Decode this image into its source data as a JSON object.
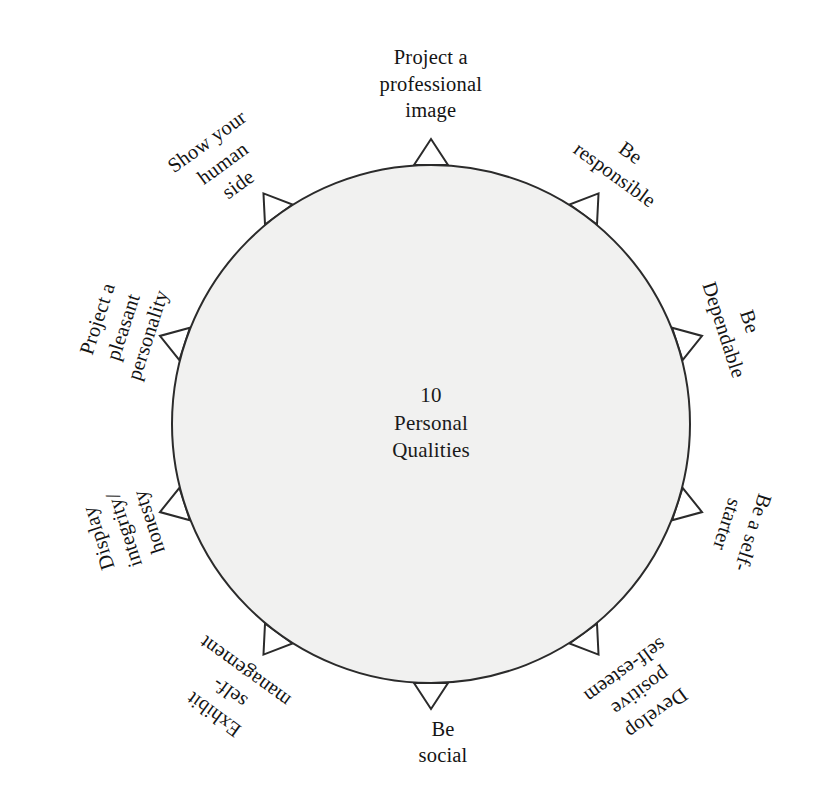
{
  "diagram": {
    "title_center": {
      "lines": [
        "10",
        "Personal",
        "Qualities"
      ]
    },
    "geometry": {
      "center_x": 431,
      "center_y": 424,
      "radius": 259,
      "marker_count": 10,
      "marker_shape": "triangle",
      "circle_fill": "#f1f1f0",
      "circle_stroke": "#2b2b2b",
      "background": "#ffffff"
    },
    "spokes": [
      {
        "name": "project-a-professional-image",
        "lines": [
          "Project a",
          "professional",
          "image"
        ],
        "angle_deg": 0,
        "label_x": 431,
        "label_y": 84,
        "rotation": 0
      },
      {
        "name": "be-responsible",
        "lines": [
          "Be",
          "responsible"
        ],
        "angle_deg": 36,
        "label_x": 623,
        "label_y": 163,
        "rotation": 36
      },
      {
        "name": "be-dependable",
        "lines": [
          "Be",
          "Dependable"
        ],
        "angle_deg": 72,
        "label_x": 737,
        "label_y": 325,
        "rotation": 72
      },
      {
        "name": "be-a-self-starter",
        "lines": [
          "Be a self-",
          "starter"
        ],
        "angle_deg": 108,
        "label_x": 740,
        "label_y": 528,
        "rotation": 108
      },
      {
        "name": "develop-positive-self-esteem",
        "lines": [
          "Develop",
          "positive",
          "self-esteem"
        ],
        "angle_deg": 144,
        "label_x": 641,
        "label_y": 692,
        "rotation": 144
      },
      {
        "name": "be-social",
        "lines": [
          "Be",
          "social"
        ],
        "angle_deg": 180,
        "label_x": 443,
        "label_y": 742,
        "rotation": 0
      },
      {
        "name": "exhibit-self-management",
        "lines": [
          "Exhibit",
          "self-",
          "management"
        ],
        "angle_deg": 216,
        "label_x": 229,
        "label_y": 693,
        "rotation": 216
      },
      {
        "name": "display-integrity-honesty",
        "lines": [
          "Display",
          "integrity/",
          "honesty"
        ],
        "angle_deg": 252,
        "label_x": 123,
        "label_y": 530,
        "rotation": 252
      },
      {
        "name": "project-a-pleasant-personality",
        "lines": [
          "Project a",
          "pleasant",
          "personality"
        ],
        "angle_deg": 288,
        "label_x": 122,
        "label_y": 327,
        "rotation": 288
      },
      {
        "name": "show-your-human-side",
        "lines": [
          "Show your",
          "human",
          "side"
        ],
        "angle_deg": 324,
        "label_x": 222,
        "label_y": 163,
        "rotation": 324
      }
    ]
  }
}
